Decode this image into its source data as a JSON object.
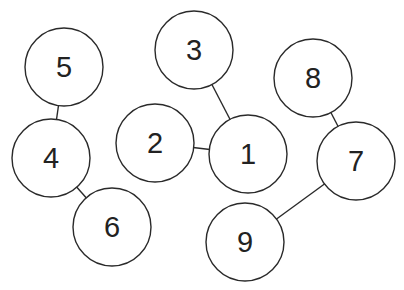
{
  "diagram": {
    "type": "undirected-graph",
    "style": {
      "stroke": "#2a2a2a",
      "fill": "#ffffff",
      "label_color": "#222222",
      "radius": 39
    },
    "nodes": [
      {
        "id": "1",
        "label": "1",
        "x": 248,
        "y": 154
      },
      {
        "id": "2",
        "label": "2",
        "x": 155,
        "y": 143
      },
      {
        "id": "3",
        "label": "3",
        "x": 194,
        "y": 50
      },
      {
        "id": "4",
        "label": "4",
        "x": 51,
        "y": 158
      },
      {
        "id": "5",
        "label": "5",
        "x": 64,
        "y": 67
      },
      {
        "id": "6",
        "label": "6",
        "x": 112,
        "y": 227
      },
      {
        "id": "7",
        "label": "7",
        "x": 356,
        "y": 161
      },
      {
        "id": "8",
        "label": "8",
        "x": 313,
        "y": 78
      },
      {
        "id": "9",
        "label": "9",
        "x": 245,
        "y": 242
      }
    ],
    "edges": [
      {
        "from": "5",
        "to": "4"
      },
      {
        "from": "4",
        "to": "6"
      },
      {
        "from": "3",
        "to": "1"
      },
      {
        "from": "2",
        "to": "1"
      },
      {
        "from": "8",
        "to": "7"
      },
      {
        "from": "7",
        "to": "9"
      }
    ]
  }
}
